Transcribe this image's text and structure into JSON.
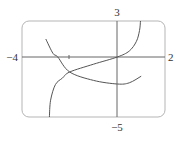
{
  "chart_data": {
    "type": "line",
    "title": "",
    "xlabel": "",
    "ylabel": "",
    "xlim": [
      -4,
      2
    ],
    "ylim": [
      -5,
      3
    ],
    "grid": false,
    "legend": null,
    "axis_labels": {
      "x_min": "−4",
      "x_max": "2",
      "y_max": "3",
      "y_min": "−5"
    },
    "x_ticks": [
      -2
    ],
    "series": [
      {
        "name": "increasing curve",
        "points": [
          [
            -2.85,
            -5
          ],
          [
            -2.8,
            -3.6
          ],
          [
            -2.6,
            -2.3
          ],
          [
            -2.3,
            -1.75
          ],
          [
            -2.0,
            -1.25
          ],
          [
            -1.0,
            -0.6
          ],
          [
            0.0,
            0.0
          ],
          [
            0.5,
            0.5
          ],
          [
            0.8,
            1.3
          ],
          [
            0.93,
            2.2
          ],
          [
            0.97,
            3
          ]
        ]
      },
      {
        "name": "decreasing curve",
        "points": [
          [
            -3.0,
            1.5
          ],
          [
            -2.7,
            0.3
          ],
          [
            -2.5,
            0.0
          ],
          [
            -2.0,
            -1.25
          ],
          [
            -1.0,
            -1.95
          ],
          [
            0.0,
            -2.25
          ],
          [
            0.5,
            -2.15
          ],
          [
            1.0,
            -1.6
          ]
        ]
      }
    ],
    "colors": {
      "curve": "#555555",
      "axes": "#666666",
      "frame": "#aaaaaa"
    }
  }
}
